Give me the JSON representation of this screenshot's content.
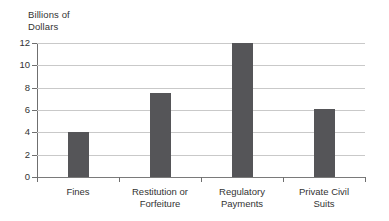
{
  "chart_data": {
    "type": "bar",
    "title": "",
    "subtitle": "",
    "xlabel": "",
    "ylabel": "Billions of\nDollars",
    "ylabel_lines": [
      "Billions of",
      "Dollars"
    ],
    "categories": [
      "Fines",
      "Restitution or Forfeiture",
      "Regulatory Payments",
      "Private Civil Suits"
    ],
    "category_label_lines": [
      [
        "Fines"
      ],
      [
        "Restitution or",
        "Forfeiture"
      ],
      [
        "Regulatory",
        "Payments"
      ],
      [
        "Private Civil",
        "Suits"
      ]
    ],
    "values": [
      4.0,
      7.5,
      12.0,
      6.1
    ],
    "ylim": [
      0,
      12
    ],
    "ytick_labels": [
      "0",
      "2",
      "4",
      "6",
      "8",
      "10",
      "12"
    ],
    "ytick_values": [
      0,
      2,
      4,
      6,
      8,
      10,
      12
    ],
    "grid": true,
    "legend": false,
    "legend_position": "none",
    "colors": {
      "bar": "#555558",
      "gridline": "#c9c9c9",
      "axis": "#6f6f6f",
      "text": "#333333",
      "background": "#ffffff"
    }
  }
}
